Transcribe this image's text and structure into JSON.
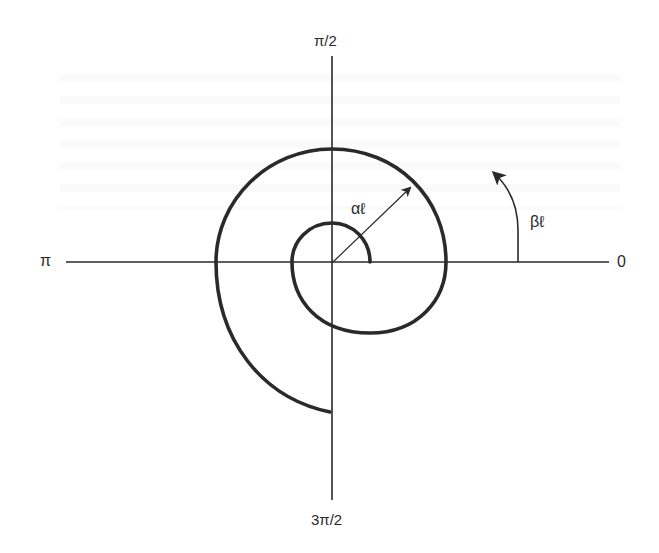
{
  "figure": {
    "type": "polar spiral diagram",
    "axis_labels": {
      "top": "π/2",
      "bottom": "3π/2",
      "left": "π",
      "right": "0"
    },
    "annotations": {
      "radius_arrow_label": "αℓ",
      "angle_arrow_label": "βℓ"
    },
    "colors": {
      "ink": "#2a2a2a",
      "background": "#ffffff"
    }
  }
}
